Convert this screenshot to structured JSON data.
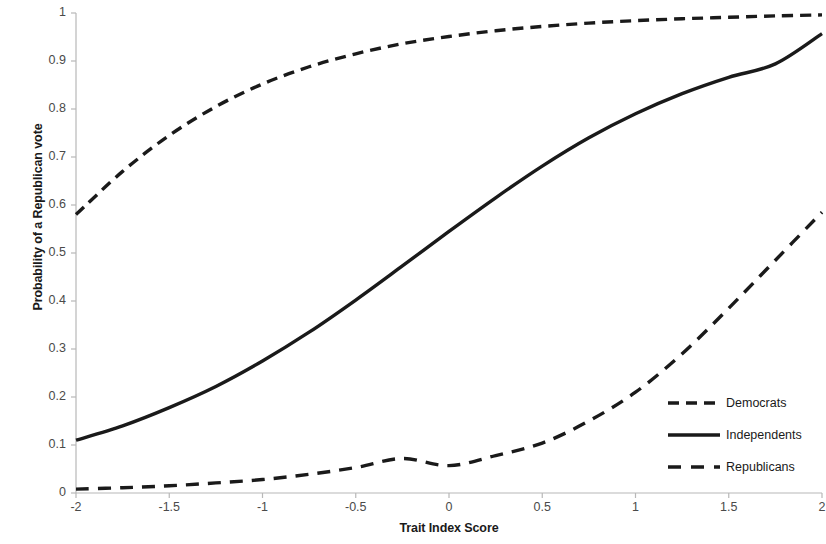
{
  "chart_data": {
    "type": "line",
    "title": "",
    "xlabel": "Trait Index Score",
    "ylabel": "Probability of a Republican vote",
    "xlim": [
      -2,
      2
    ],
    "ylim": [
      0,
      1
    ],
    "xticks": [
      "-2",
      "-1.5",
      "-1",
      "-0.5",
      "0",
      "0.5",
      "1",
      "1.5",
      "2"
    ],
    "xtick_values": [
      -2,
      -1.5,
      -1,
      -0.5,
      0,
      0.5,
      1,
      1.5,
      2
    ],
    "yticks": [
      "0",
      "0.1",
      "0.2",
      "0.3",
      "0.4",
      "0.5",
      "0.6",
      "0.7",
      "0.8",
      "0.9",
      "1"
    ],
    "ytick_values": [
      0,
      0.1,
      0.2,
      0.3,
      0.4,
      0.5,
      0.6,
      0.7,
      0.8,
      0.9,
      1
    ],
    "grid": false,
    "legend_position": "center right",
    "x": [
      -2,
      -1.75,
      -1.5,
      -1.25,
      -1,
      -0.75,
      -0.5,
      -0.25,
      0,
      0.25,
      0.5,
      0.75,
      1,
      1.25,
      1.5,
      1.75,
      2
    ],
    "series": [
      {
        "name": "Democrats",
        "style": "dashed",
        "color": "#1a1a1a",
        "values": [
          0.58,
          0.67,
          0.745,
          0.805,
          0.852,
          0.888,
          0.915,
          0.936,
          0.951,
          0.963,
          0.972,
          0.979,
          0.984,
          0.988,
          0.991,
          0.994,
          0.996
        ]
      },
      {
        "name": "Independents",
        "style": "solid",
        "color": "#1a1a1a",
        "values": [
          0.11,
          0.14,
          0.178,
          0.222,
          0.275,
          0.335,
          0.402,
          0.473,
          0.545,
          0.615,
          0.681,
          0.74,
          0.79,
          0.832,
          0.866,
          0.894,
          0.957
        ]
      },
      {
        "name": "Republicans",
        "style": "long-dashed",
        "color": "#1a1a1a",
        "values": [
          0.008,
          0.011,
          0.015,
          0.021,
          0.028,
          0.039,
          0.053,
          0.072,
          0.057,
          0.078,
          0.104,
          0.15,
          0.21,
          0.29,
          0.385,
          0.485,
          0.585
        ]
      }
    ]
  },
  "axis": {
    "y_label_text": "Probability of a Republican vote",
    "x_label_text": "Trait Index Score"
  },
  "legend": {
    "items": [
      {
        "label": "Democrats",
        "style": "dashed"
      },
      {
        "label": "Independents",
        "style": "solid"
      },
      {
        "label": "Republicans",
        "style": "long-dashed"
      }
    ]
  }
}
